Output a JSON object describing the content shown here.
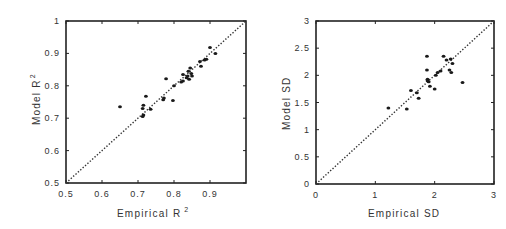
{
  "chart_data": [
    {
      "type": "scatter",
      "title": "",
      "xlabel": "Empirical R 2",
      "ylabel": "Model R 2",
      "xlim": [
        0.5,
        1.0
      ],
      "ylim": [
        0.5,
        1.0
      ],
      "xticks": [
        "0.5",
        "0.6",
        "0.7",
        "0.8",
        "0.9"
      ],
      "yticks": [
        "0.5",
        "0.6",
        "0.7",
        "0.8",
        "0.9",
        "1"
      ],
      "grid": false,
      "legend": null,
      "reference_line": {
        "type": "identity",
        "style": "dotted",
        "from": [
          0.5,
          0.5
        ],
        "to": [
          1.0,
          1.0
        ]
      },
      "series": [
        {
          "name": "R2",
          "x": [
            0.65,
            0.713,
            0.715,
            0.713,
            0.715,
            0.722,
            0.735,
            0.77,
            0.772,
            0.778,
            0.797,
            0.8,
            0.82,
            0.825,
            0.825,
            0.835,
            0.838,
            0.84,
            0.842,
            0.845,
            0.848,
            0.85,
            0.872,
            0.875,
            0.885,
            0.89,
            0.9,
            0.915
          ],
          "y": [
            0.735,
            0.705,
            0.71,
            0.73,
            0.74,
            0.768,
            0.728,
            0.757,
            0.762,
            0.822,
            0.755,
            0.8,
            0.812,
            0.815,
            0.835,
            0.825,
            0.83,
            0.845,
            0.82,
            0.855,
            0.838,
            0.83,
            0.875,
            0.86,
            0.88,
            0.882,
            0.918,
            0.9
          ]
        }
      ]
    },
    {
      "type": "scatter",
      "title": "",
      "xlabel": "Empirical SD",
      "ylabel": "Model SD",
      "xlim": [
        0,
        3
      ],
      "ylim": [
        0,
        3
      ],
      "xticks": [
        "0",
        "1",
        "2",
        "3"
      ],
      "yticks": [
        "0",
        "0.5",
        "1",
        "1.5",
        "2",
        "2.5",
        "3"
      ],
      "grid": false,
      "legend": null,
      "reference_line": {
        "type": "identity",
        "style": "dotted",
        "from": [
          0,
          0
        ],
        "to": [
          3,
          3
        ]
      },
      "series": [
        {
          "name": "SD",
          "x": [
            1.22,
            1.53,
            1.6,
            1.7,
            1.73,
            1.87,
            1.87,
            1.88,
            1.88,
            1.9,
            1.92,
            2.0,
            2.02,
            2.05,
            2.1,
            2.15,
            2.2,
            2.25,
            2.28,
            2.27,
            2.3,
            2.47
          ],
          "y": [
            1.4,
            1.38,
            1.72,
            1.68,
            1.58,
            2.35,
            2.1,
            1.93,
            1.9,
            1.88,
            1.8,
            1.75,
            2.0,
            2.05,
            2.08,
            2.35,
            2.28,
            2.1,
            2.05,
            2.3,
            2.22,
            1.87
          ]
        }
      ]
    }
  ],
  "panels": [
    {
      "xlabel_main": "Empirical R",
      "xlabel_sup": "2",
      "ylabel_main": "Model R",
      "ylabel_sup": "2"
    },
    {
      "xlabel_main": "Empirical SD",
      "ylabel_main": "Model SD"
    }
  ],
  "colors": {
    "frame": "#222222",
    "points": "#1a1a1a",
    "reference_line": "#333333",
    "text": "#333333"
  }
}
